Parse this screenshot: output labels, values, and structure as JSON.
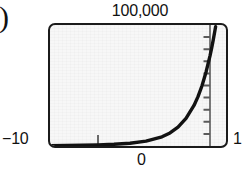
{
  "figure": {
    "enumeration_mark": ")"
  },
  "labels": {
    "y_max": "100,000",
    "x_min": "−10",
    "x_zero": "0",
    "x_max": "1"
  },
  "colors": {
    "frame_border": "#1b1b1b",
    "screen_background": "#f7f7f7",
    "curve": "#121212",
    "axis": "#5a5a5a",
    "text": "#111111"
  },
  "chart_data": {
    "type": "line",
    "title": "",
    "subtitle": "",
    "xlabel": "",
    "ylabel": "",
    "xlim": [
      -10,
      1
    ],
    "ylim": [
      0,
      100000
    ],
    "grid": false,
    "legend": null,
    "axis_ticks": {
      "y_axis_x_value": 0,
      "y_tick_count": 10,
      "y_tick_step": 10000,
      "x_tick_values": [
        -7,
        0,
        3.5
      ],
      "tick_direction": "inward-left"
    },
    "annotations": [
      {
        "text": "100,000",
        "position": "above-top-edge",
        "describes": "y-axis maximum"
      },
      {
        "text": "−10",
        "position": "left-of-bottom-left-corner",
        "describes": "x-axis minimum"
      },
      {
        "text": "0",
        "position": "below-y-axis",
        "describes": "x = 0"
      },
      {
        "text": "1",
        "position": "right-of-bottom-right-corner",
        "describes": "x-axis maximum"
      }
    ],
    "series": [
      {
        "name": "exponential curve",
        "x": [
          -10,
          -9,
          -8,
          -7,
          -6,
          -5,
          -4,
          -3,
          -2.5,
          -2,
          -1.5,
          -1,
          -0.75,
          -0.5,
          -0.25,
          0,
          0.1,
          0.2,
          0.3,
          0.35
        ],
        "y": [
          300,
          430,
          620,
          900,
          1400,
          2300,
          4000,
          7600,
          10800,
          15600,
          22800,
          33500,
          40800,
          49800,
          61000,
          74500,
          80700,
          87500,
          94800,
          98600
        ]
      }
    ]
  }
}
